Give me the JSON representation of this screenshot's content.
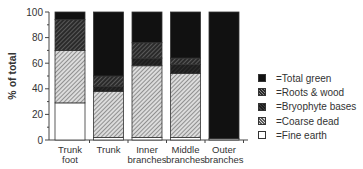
{
  "chart_data": {
    "type": "bar",
    "stacked": true,
    "title": "",
    "xlabel": "",
    "ylabel": "% of total",
    "ylim": [
      0,
      100
    ],
    "yticks": [
      0,
      20,
      40,
      60,
      80,
      100
    ],
    "grid": false,
    "legend_position": "right",
    "categories": [
      "Trunk foot",
      "Trunk",
      "Inner branches",
      "Middle branches",
      "Outer branches"
    ],
    "category_lines": [
      [
        "Trunk",
        "foot"
      ],
      [
        "Trunk"
      ],
      [
        "Inner",
        "branches"
      ],
      [
        "Middle",
        "branches"
      ],
      [
        "Outer",
        "branches"
      ]
    ],
    "series": [
      {
        "name": "Fine earth",
        "legend_label": "=Fine earth",
        "pattern": "white",
        "values": [
          29,
          2,
          2,
          2,
          1
        ]
      },
      {
        "name": "Coarse dead",
        "legend_label": "=Coarse dead",
        "pattern": "light-hatch",
        "values": [
          41,
          36,
          56,
          50,
          0
        ]
      },
      {
        "name": "Bryophyte bases",
        "legend_label": "=Bryophyte bases",
        "pattern": "dark",
        "values": [
          0,
          4,
          6,
          7,
          0
        ]
      },
      {
        "name": "Roots & wood",
        "legend_label": "=Roots & wood",
        "pattern": "dark-hatch",
        "values": [
          24,
          8,
          12,
          5,
          0
        ]
      },
      {
        "name": "Total green",
        "legend_label": "=Total green",
        "pattern": "black",
        "values": [
          6,
          50,
          24,
          36,
          99
        ]
      }
    ]
  },
  "legend_order": [
    "Total green",
    "Roots & wood",
    "Bryophyte bases",
    "Coarse dead",
    "Fine earth"
  ],
  "colors": {
    "black": "#111111",
    "dark": "#262626",
    "dark_hatch_bg": "#3a3a3a",
    "light_hatch_bg": "#d8d8d8",
    "hatch_line": "#777777",
    "white": "#ffffff",
    "axis": "#444444"
  }
}
